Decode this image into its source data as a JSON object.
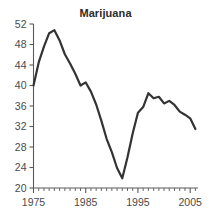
{
  "chart_data": {
    "type": "line",
    "title": "Marijuana",
    "xlabel": "",
    "ylabel": "",
    "xlim": [
      1975,
      2006.5
    ],
    "ylim": [
      20,
      52
    ],
    "grid": false,
    "legend": null,
    "series_color": "#333333",
    "x": [
      1975,
      1976,
      1977,
      1978,
      1979,
      1980,
      1981,
      1982,
      1983,
      1984,
      1985,
      1986,
      1987,
      1988,
      1989,
      1990,
      1991,
      1992,
      1993,
      1994,
      1995,
      1996,
      1997,
      1998,
      1999,
      2000,
      2001,
      2002,
      2003,
      2004,
      2005,
      2006
    ],
    "values": [
      40.0,
      44.5,
      47.6,
      50.2,
      50.8,
      48.8,
      46.1,
      44.3,
      42.3,
      40.0,
      40.6,
      38.8,
      36.3,
      33.1,
      29.6,
      27.0,
      23.9,
      21.9,
      26.0,
      30.7,
      34.7,
      35.8,
      38.5,
      37.5,
      37.8,
      36.5,
      37.0,
      36.2,
      34.9,
      34.3,
      33.6,
      31.5
    ],
    "series": [
      {
        "name": "Marijuana",
        "values": [
          40.0,
          44.5,
          47.6,
          50.2,
          50.8,
          48.8,
          46.1,
          44.3,
          42.3,
          40.0,
          40.6,
          38.8,
          36.3,
          33.1,
          29.6,
          27.0,
          23.9,
          21.9,
          26.0,
          30.7,
          34.7,
          35.8,
          38.5,
          37.5,
          37.8,
          36.5,
          37.0,
          36.2,
          34.9,
          34.3,
          33.6,
          31.5
        ]
      }
    ],
    "yticks": [
      20,
      24,
      28,
      32,
      36,
      40,
      44,
      48,
      52
    ],
    "ytick_labels": [
      "20",
      "24",
      "28",
      "32",
      "36",
      "40",
      "44",
      "48",
      "52"
    ],
    "xticks": [
      1975,
      1985,
      1995,
      2005
    ],
    "xtick_labels": [
      "1975",
      "1985",
      "1995",
      "2005"
    ],
    "xminor_step": 1
  }
}
